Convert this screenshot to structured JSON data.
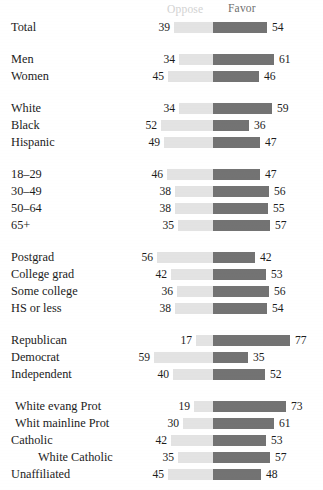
{
  "header": {
    "oppose_label": "Oppose",
    "favor_label": "Favor",
    "oppose_color": "#e3e3e3",
    "favor_color": "#737373"
  },
  "chart_data": {
    "type": "bar",
    "title": "",
    "subtitle": "",
    "xlabel": "",
    "ylabel": "",
    "grid": false,
    "legend_position": "top",
    "orientation": "horizontal",
    "style": "diverging-stacked",
    "center_value": 0,
    "xlim": [
      -60,
      80
    ],
    "series": [
      {
        "name": "Oppose",
        "color": "#e3e3e3",
        "direction": "left"
      },
      {
        "name": "Favor",
        "color": "#737373",
        "direction": "right"
      }
    ],
    "groups": [
      {
        "name": "total",
        "rows": [
          {
            "category": "Total",
            "indent": 0,
            "oppose": 39,
            "favor": 54
          }
        ]
      },
      {
        "name": "gender",
        "rows": [
          {
            "category": "Men",
            "indent": 0,
            "oppose": 34,
            "favor": 61
          },
          {
            "category": "Women",
            "indent": 0,
            "oppose": 45,
            "favor": 46
          }
        ]
      },
      {
        "name": "race",
        "rows": [
          {
            "category": "White",
            "indent": 0,
            "oppose": 34,
            "favor": 59
          },
          {
            "category": "Black",
            "indent": 0,
            "oppose": 52,
            "favor": 36
          },
          {
            "category": "Hispanic",
            "indent": 0,
            "oppose": 49,
            "favor": 47
          }
        ]
      },
      {
        "name": "age",
        "rows": [
          {
            "category": "18–29",
            "indent": 0,
            "oppose": 46,
            "favor": 47
          },
          {
            "category": "30–49",
            "indent": 0,
            "oppose": 38,
            "favor": 56
          },
          {
            "category": "50–64",
            "indent": 0,
            "oppose": 38,
            "favor": 55
          },
          {
            "category": "65+",
            "indent": 0,
            "oppose": 35,
            "favor": 57
          }
        ]
      },
      {
        "name": "education",
        "rows": [
          {
            "category": "Postgrad",
            "indent": 0,
            "oppose": 56,
            "favor": 42
          },
          {
            "category": "College grad",
            "indent": 0,
            "oppose": 42,
            "favor": 53
          },
          {
            "category": "Some college",
            "indent": 0,
            "oppose": 36,
            "favor": 56
          },
          {
            "category": "HS or less",
            "indent": 0,
            "oppose": 38,
            "favor": 54
          }
        ]
      },
      {
        "name": "party",
        "rows": [
          {
            "category": "Republican",
            "indent": 0,
            "oppose": 17,
            "favor": 77
          },
          {
            "category": "Democrat",
            "indent": 0,
            "oppose": 59,
            "favor": 35
          },
          {
            "category": "Independent",
            "indent": 0,
            "oppose": 40,
            "favor": 52
          }
        ]
      },
      {
        "name": "religion",
        "rows": [
          {
            "category": "White evang Prot",
            "indent": 1,
            "oppose": 19,
            "favor": 73
          },
          {
            "category": "Whit mainline Prot",
            "indent": 1,
            "oppose": 30,
            "favor": 61
          },
          {
            "category": "Catholic",
            "indent": 0,
            "oppose": 42,
            "favor": 53
          },
          {
            "category": "White Catholic",
            "indent": 2,
            "oppose": 35,
            "favor": 57
          },
          {
            "category": "Unaffiliated",
            "indent": 0,
            "oppose": 45,
            "favor": 48
          }
        ]
      }
    ]
  }
}
